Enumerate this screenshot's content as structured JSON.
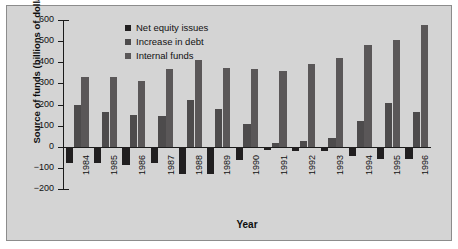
{
  "chart_data": {
    "type": "bar",
    "title": "",
    "xlabel": "Year",
    "ylabel": "Source of funds (billions of dollars)",
    "ylim": [
      -200,
      600
    ],
    "yticks": [
      600,
      500,
      400,
      300,
      200,
      100,
      0,
      -100,
      -200
    ],
    "ytick_labels": [
      "600",
      "500",
      "400",
      "300",
      "200",
      "100",
      "0",
      "−100",
      "−200"
    ],
    "grid": false,
    "legend_position": "top-center",
    "categories": [
      "1984",
      "1985",
      "1986",
      "1987",
      "1988",
      "1989",
      "1990",
      "1991",
      "1992",
      "1993",
      "1994",
      "1995",
      "1996"
    ],
    "series": [
      {
        "name": "Net equity issues",
        "color": "#211f20",
        "values": [
          -79,
          -77,
          -85,
          -76,
          -129,
          -131,
          -63,
          -16,
          -22,
          -21,
          -44,
          -58,
          -56
        ]
      },
      {
        "name": "Increase in debt",
        "color": "#4d4b4c",
        "values": [
          198,
          163,
          148,
          146,
          219,
          178,
          110,
          18,
          25,
          40,
          124,
          205,
          163
        ]
      },
      {
        "name": "Internal funds",
        "color": "#5a5758",
        "values": [
          328,
          331,
          311,
          366,
          412,
          375,
          369,
          358,
          392,
          421,
          483,
          506,
          578
        ]
      }
    ]
  }
}
